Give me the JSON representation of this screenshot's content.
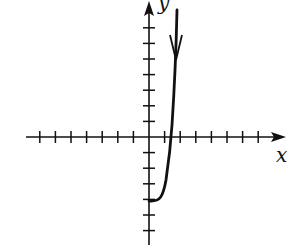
{
  "chart_data": {
    "type": "line",
    "title": "",
    "xlabel": "x",
    "ylabel": "y",
    "grid": false,
    "x_ticks": [
      -7,
      -6,
      -5,
      -4,
      -3,
      -2,
      -1,
      1,
      2,
      3,
      4,
      5,
      6,
      7
    ],
    "y_ticks": [
      -6,
      -5,
      -4,
      -3,
      -2,
      -1,
      1,
      2,
      3,
      4,
      5,
      6,
      7
    ],
    "xlim": [
      -8,
      9
    ],
    "ylim": [
      -6.5,
      8.5
    ],
    "tick_labels_shown": false,
    "series": [
      {
        "name": "curve",
        "description": "Curve starting at (0,-4) with horizontal tangent, rising steeply, crossing x-axis near x=1.4, continuing nearly vertically upward past y=8; downward-pointing arrowhead on the upper part indicating direction.",
        "points": [
          [
            0,
            -4
          ],
          [
            0.5,
            -3.8
          ],
          [
            1.0,
            -2.5
          ],
          [
            1.4,
            0
          ],
          [
            1.6,
            2.5
          ],
          [
            1.8,
            5.0
          ],
          [
            1.85,
            8.2
          ]
        ],
        "arrow": {
          "at": [
            1.8,
            5
          ],
          "direction": "down"
        }
      }
    ]
  },
  "labels": {
    "x_axis": "x",
    "y_axis": "y"
  },
  "colors": {
    "stroke": "#111111",
    "background": "#ffffff"
  }
}
